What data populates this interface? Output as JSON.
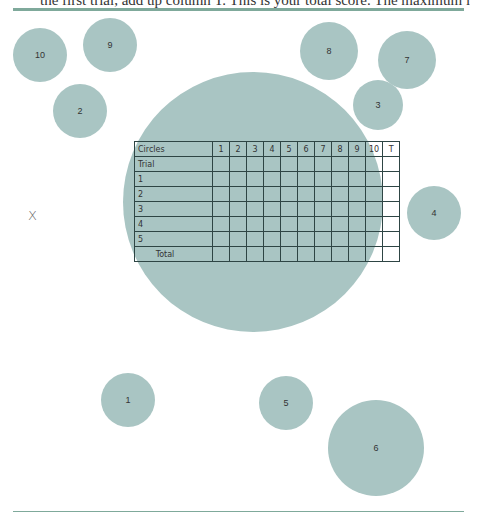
{
  "page": {
    "top_text": "the first trial, add up column T. This is your total score. The maximum is 50",
    "colors": {
      "circle": "#a9c5c3",
      "rule": "#7fa99b",
      "grid": "#2e4544"
    }
  },
  "start_mark": "X",
  "circles": [
    {
      "label": "10",
      "cx": 40,
      "cy": 55,
      "r": 27
    },
    {
      "label": "9",
      "cx": 110,
      "cy": 45,
      "r": 27
    },
    {
      "label": "2",
      "cx": 80,
      "cy": 111,
      "r": 27
    },
    {
      "label": "8",
      "cx": 329,
      "cy": 51,
      "r": 29
    },
    {
      "label": "7",
      "cx": 407,
      "cy": 60,
      "r": 29
    },
    {
      "label": "3",
      "cx": 378,
      "cy": 105,
      "r": 25
    },
    {
      "label": "4",
      "cx": 434,
      "cy": 213,
      "r": 27
    },
    {
      "label": "1",
      "cx": 128,
      "cy": 400,
      "r": 27
    },
    {
      "label": "5",
      "cx": 286,
      "cy": 403,
      "r": 27
    },
    {
      "label": "6",
      "cx": 376,
      "cy": 448,
      "r": 48
    }
  ],
  "big_circle": {
    "cx": 253,
    "cy": 202,
    "r": 130
  },
  "table": {
    "header_label": "Circles",
    "columns": [
      "1",
      "2",
      "3",
      "4",
      "5",
      "6",
      "7",
      "8",
      "9",
      "10",
      "T"
    ],
    "rows": [
      "Trial",
      "1",
      "2",
      "3",
      "4",
      "5"
    ],
    "total_label": "Total"
  }
}
